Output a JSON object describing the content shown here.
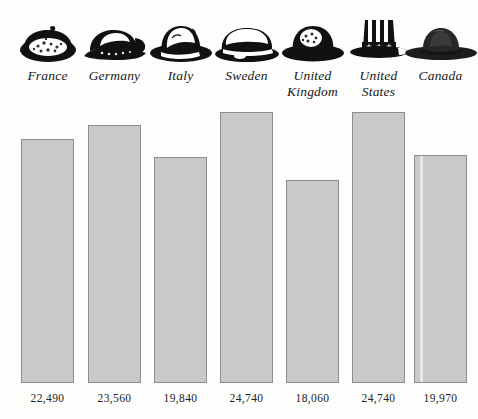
{
  "chart_data": {
    "type": "bar",
    "title": "",
    "subtitle": "",
    "xlabel": "",
    "ylabel": "",
    "grid": false,
    "legend": false,
    "axis_visible": false,
    "value_label_position": "below-bar",
    "categories": [
      "France",
      "Germany",
      "Italy",
      "Sweden",
      "United Kingdom",
      "United States",
      "Canada"
    ],
    "category_labels_display": [
      "France",
      "Germany",
      "Italy",
      "Sweden",
      "United\nKingdom",
      "United\nStates",
      "Canada"
    ],
    "values": [
      22490,
      23560,
      19840,
      24740,
      18060,
      24740,
      19970
    ],
    "value_labels": [
      "22,490",
      "23,560",
      "19,840",
      "24,740",
      "18,060",
      "24,740",
      "19,970"
    ],
    "bar_fill": "#c9c9c9",
    "bar_border": "#8e8e8e",
    "background": "#fdfdfb",
    "baseline_value": 15500,
    "ylim": [
      15500,
      25400
    ],
    "bars": [
      {
        "category": "France",
        "value": 22490,
        "label": "22,490",
        "left": 21,
        "width": 53,
        "top": 139,
        "bottom": 383,
        "icon": "beret-hat-icon",
        "streak": false
      },
      {
        "category": "Germany",
        "value": 23560,
        "label": "23,560",
        "left": 88,
        "width": 53,
        "top": 125,
        "bottom": 383,
        "icon": "flat-cap-hat-icon",
        "streak": false
      },
      {
        "category": "Italy",
        "value": 19840,
        "label": "19,840",
        "left": 154,
        "width": 53,
        "top": 157,
        "bottom": 383,
        "icon": "fedora-hat-icon",
        "streak": false
      },
      {
        "category": "Sweden",
        "value": 24740,
        "label": "24,740",
        "left": 220,
        "width": 53,
        "top": 112,
        "bottom": 383,
        "icon": "brimmed-cap-hat-icon",
        "streak": false
      },
      {
        "category": "United Kingdom",
        "value": 18060,
        "label": "18,060",
        "left": 286,
        "width": 53,
        "top": 180,
        "bottom": 383,
        "icon": "bowler-hat-icon",
        "streak": false
      },
      {
        "category": "United States",
        "value": 24740,
        "label": "24,740",
        "left": 352,
        "width": 53,
        "top": 112,
        "bottom": 383,
        "icon": "uncle-sam-top-hat-icon",
        "streak": false
      },
      {
        "category": "Canada",
        "value": 19970,
        "label": "19,970",
        "left": 414,
        "width": 53,
        "top": 155,
        "bottom": 383,
        "icon": "mountie-hat-icon",
        "streak": true
      }
    ]
  }
}
